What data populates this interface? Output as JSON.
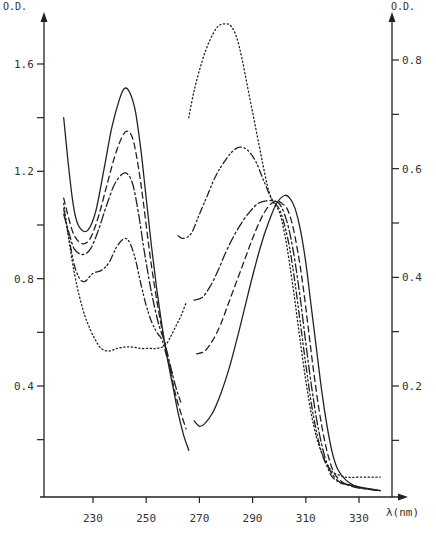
{
  "chart_data": {
    "type": "line",
    "title": "",
    "xlabel": "λ (nm)",
    "ylabel_left": "O.D.",
    "ylabel_right": "O.D.",
    "xlim": [
      215,
      340
    ],
    "ylim_left": [
      0.0,
      1.7
    ],
    "ylim_right": [
      0.0,
      0.85
    ],
    "grid": false,
    "legend": "none",
    "x_ticks": [
      230,
      250,
      270,
      290,
      310,
      330
    ],
    "x_tick_labels": [
      "230",
      "250",
      "270",
      "290",
      "310",
      "330"
    ],
    "y_left_ticks": [
      0.4,
      0.8,
      1.2,
      1.6
    ],
    "y_left_tick_labels": [
      "0.4",
      "0.8",
      "1.2",
      "1.6"
    ],
    "y_left_minor_ticks": [
      0.2,
      0.6,
      1.0,
      1.4
    ],
    "y_right_ticks": [
      0.2,
      0.4,
      0.6,
      0.8
    ],
    "y_right_tick_labels": [
      "0.2",
      "0.4",
      "0.6",
      "0.8"
    ],
    "y_right_minor_ticks": [
      0.1,
      0.3,
      0.5,
      0.7
    ],
    "annotations": [
      "isosbestic point near 257 nm",
      "isosbestic point near 300 nm"
    ],
    "series": [
      {
        "name": "solid",
        "style": "solid",
        "axis": "left",
        "segments": [
          {
            "x": [
              219,
              221,
              223,
              225,
              228,
              231,
              234,
              237,
              240,
              242,
              244,
              246,
              248,
              250,
              252,
              254,
              256,
              258,
              260,
              262,
              264,
              266
            ],
            "y": [
              1.4,
              1.2,
              1.05,
              0.99,
              0.98,
              1.05,
              1.2,
              1.36,
              1.47,
              1.51,
              1.49,
              1.42,
              1.28,
              1.1,
              0.92,
              0.76,
              0.62,
              0.5,
              0.4,
              0.3,
              0.22,
              0.16
            ]
          },
          {
            "x": [
              268,
              270,
              272,
              275,
              278,
              281,
              284,
              287,
              290,
              293,
              296,
              299,
              302,
              304,
              306,
              308,
              310,
              312,
              314,
              316,
              318,
              320,
              322,
              325,
              328,
              332,
              338
            ],
            "y": [
              0.27,
              0.25,
              0.26,
              0.3,
              0.37,
              0.46,
              0.57,
              0.69,
              0.81,
              0.92,
              1.01,
              1.08,
              1.11,
              1.1,
              1.06,
              0.98,
              0.86,
              0.7,
              0.54,
              0.38,
              0.25,
              0.15,
              0.09,
              0.05,
              0.03,
              0.02,
              0.01
            ]
          }
        ]
      },
      {
        "name": "dashed",
        "style": "dashed",
        "axis": "left",
        "segments": [
          {
            "x": [
              219,
              221,
              223,
              226,
              229,
              232,
              235,
              238,
              241,
              243,
              245,
              247,
              249,
              251,
              253,
              255,
              257,
              259,
              261,
              263,
              265
            ],
            "y": [
              1.1,
              1.02,
              0.96,
              0.93,
              0.95,
              1.03,
              1.14,
              1.25,
              1.33,
              1.35,
              1.32,
              1.22,
              1.08,
              0.92,
              0.78,
              0.66,
              0.56,
              0.46,
              0.37,
              0.3,
              0.24
            ]
          },
          {
            "x": [
              269,
              272,
              275,
              278,
              281,
              284,
              287,
              290,
              293,
              296,
              299,
              301,
              303,
              305,
              307,
              309,
              311,
              313,
              315,
              317,
              319,
              321,
              324,
              327,
              331,
              338
            ],
            "y": [
              0.52,
              0.53,
              0.57,
              0.63,
              0.71,
              0.79,
              0.87,
              0.95,
              1.02,
              1.07,
              1.09,
              1.08,
              1.06,
              1.0,
              0.9,
              0.77,
              0.61,
              0.45,
              0.31,
              0.2,
              0.12,
              0.07,
              0.04,
              0.03,
              0.02,
              0.01
            ]
          }
        ]
      },
      {
        "name": "long-dash-dot",
        "style": "dashdot",
        "axis": "left",
        "segments": [
          {
            "x": [
              219,
              221,
              223,
              226,
              229,
              232,
              235,
              238,
              241,
              243,
              245,
              247,
              249,
              251,
              253,
              255,
              257,
              259,
              261,
              263
            ],
            "y": [
              1.04,
              0.97,
              0.91,
              0.89,
              0.91,
              0.98,
              1.07,
              1.15,
              1.19,
              1.19,
              1.15,
              1.05,
              0.92,
              0.8,
              0.7,
              0.62,
              0.56,
              0.48,
              0.4,
              0.34
            ]
          },
          {
            "x": [
              268,
              271,
              274,
              277,
              280,
              283,
              286,
              289,
              292,
              295,
              298,
              300,
              302,
              304,
              306,
              308,
              310,
              312,
              314,
              316,
              318,
              320,
              323,
              326,
              330,
              338
            ],
            "y": [
              0.72,
              0.73,
              0.77,
              0.83,
              0.9,
              0.96,
              1.01,
              1.05,
              1.08,
              1.09,
              1.09,
              1.08,
              1.04,
              0.97,
              0.86,
              0.72,
              0.56,
              0.41,
              0.28,
              0.18,
              0.11,
              0.07,
              0.04,
              0.03,
              0.02,
              0.01
            ]
          }
        ]
      },
      {
        "name": "dash-dot-dot",
        "style": "dashdotdot",
        "axis": "left",
        "segments": [
          {
            "x": [
              219,
              221,
              223,
              225,
              227,
              230,
              233,
              236,
              239,
              242,
              244,
              246,
              248,
              250,
              252,
              254,
              256,
              258,
              260
            ],
            "y": [
              1.06,
              0.95,
              0.85,
              0.8,
              0.79,
              0.82,
              0.83,
              0.86,
              0.92,
              0.95,
              0.93,
              0.87,
              0.78,
              0.7,
              0.64,
              0.6,
              0.57,
              0.5,
              0.44
            ]
          },
          {
            "x": [
              262,
              264,
              267,
              270,
              273,
              276,
              279,
              282,
              285,
              288,
              291,
              294,
              297,
              300,
              302,
              304,
              306,
              308,
              310,
              312,
              314,
              316,
              318,
              320,
              323,
              327,
              331,
              338
            ],
            "y": [
              0.96,
              0.95,
              0.97,
              1.04,
              1.11,
              1.18,
              1.23,
              1.27,
              1.29,
              1.28,
              1.24,
              1.17,
              1.1,
              1.06,
              1.0,
              0.91,
              0.78,
              0.63,
              0.48,
              0.34,
              0.23,
              0.15,
              0.1,
              0.06,
              0.04,
              0.03,
              0.02,
              0.01
            ]
          }
        ]
      },
      {
        "name": "dotted",
        "style": "dotted",
        "axis": "left",
        "segments": [
          {
            "x": [
              219,
              221,
              223,
              225,
              227,
              229,
              231,
              233,
              236,
              239,
              242,
              245,
              248,
              251,
              254,
              257,
              259,
              261,
              263,
              265
            ],
            "y": [
              1.08,
              0.94,
              0.82,
              0.73,
              0.66,
              0.61,
              0.57,
              0.54,
              0.53,
              0.54,
              0.545,
              0.545,
              0.54,
              0.54,
              0.54,
              0.55,
              0.58,
              0.62,
              0.66,
              0.71
            ]
          },
          {
            "x": [
              266,
              268,
              271,
              274,
              277,
              280,
              282,
              284,
              286,
              288,
              290,
              292,
              294,
              296,
              298,
              300,
              302,
              304,
              306,
              308,
              310,
              312,
              314,
              316,
              318,
              320,
              322,
              325,
              330,
              338
            ],
            "y": [
              1.4,
              1.5,
              1.61,
              1.69,
              1.74,
              1.75,
              1.74,
              1.7,
              1.62,
              1.52,
              1.42,
              1.32,
              1.22,
              1.13,
              1.08,
              1.05,
              0.97,
              0.85,
              0.71,
              0.56,
              0.42,
              0.3,
              0.21,
              0.15,
              0.11,
              0.08,
              0.07,
              0.06,
              0.06,
              0.06
            ]
          }
        ]
      }
    ]
  },
  "layout": {
    "plot_px": {
      "x0": 44,
      "x_right_axis": 392,
      "y_baseline": 497
    },
    "x_map": {
      "v1": 230,
      "px1": 93,
      "v2": 330,
      "px2": 359
    },
    "y_left_map": {
      "v1": 0.4,
      "px1": 386,
      "v2": 1.6,
      "px2": 64
    },
    "y_right_map": {
      "v1": 0.2,
      "px1": 386,
      "v2": 0.8,
      "px2": 60
    }
  },
  "labels": {
    "left_axis_title": "O.D.",
    "right_axis_title": "O.D.",
    "x_axis_title": "λ(nm)"
  },
  "colors": {
    "ink": "#222222",
    "text": "#333333",
    "background": "#ffffff"
  }
}
